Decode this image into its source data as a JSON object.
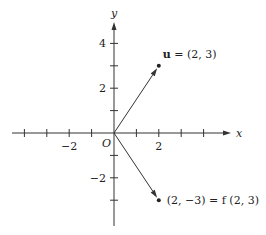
{
  "diagram": {
    "origin_px": [
      114,
      133
    ],
    "unit_px": 22.4,
    "x_axis": {
      "label": "x",
      "min_px": 12,
      "max_px": 231,
      "ticks": [
        -4,
        -3,
        -2,
        -1,
        1,
        2,
        3,
        4
      ],
      "labeled_ticks": [
        {
          "value": -2,
          "text": "−2"
        },
        {
          "value": 2,
          "text": "2"
        }
      ]
    },
    "y_axis": {
      "label": "y",
      "min_px": 226,
      "max_px": 22,
      "ticks": [
        -3,
        -2,
        -1,
        1,
        2,
        3,
        4
      ],
      "labeled_ticks": [
        {
          "value": 4,
          "text": "4"
        },
        {
          "value": 2,
          "text": "2"
        },
        {
          "value": -2,
          "text": "−2"
        }
      ]
    },
    "origin_label": "O",
    "vectors": [
      {
        "name": "u",
        "to": [
          2,
          3
        ],
        "label_bold": "u",
        "label_rest": " = (2, 3)",
        "label_offset": [
          4,
          -8
        ]
      },
      {
        "name": "f-of-u",
        "to": [
          2,
          -3
        ],
        "label_bold": "",
        "label_rest": "(2, −3) = f (2, 3)",
        "label_offset": [
          8,
          4
        ]
      }
    ],
    "color": "#333333"
  }
}
